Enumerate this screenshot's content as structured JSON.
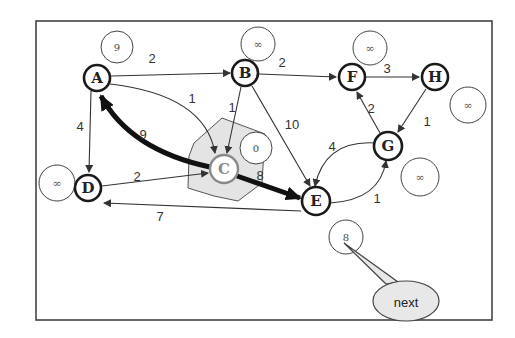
{
  "diagram": {
    "type": "weighted directed graph - Dijkstra shortest path step",
    "current_node": "C",
    "nodes": [
      {
        "id": "A",
        "label": "A",
        "x": 97,
        "y": 78,
        "distance": "9"
      },
      {
        "id": "B",
        "label": "B",
        "x": 245,
        "y": 73,
        "distance": "∞"
      },
      {
        "id": "C",
        "label": "C",
        "x": 224,
        "y": 169,
        "distance": "0"
      },
      {
        "id": "D",
        "label": "D",
        "x": 88,
        "y": 188,
        "distance": "∞"
      },
      {
        "id": "E",
        "label": "E",
        "x": 316,
        "y": 201,
        "distance": "8"
      },
      {
        "id": "F",
        "label": "F",
        "x": 352,
        "y": 77,
        "distance": "∞"
      },
      {
        "id": "G",
        "label": "G",
        "x": 388,
        "y": 146,
        "distance": "∞"
      },
      {
        "id": "H",
        "label": "H",
        "x": 435,
        "y": 77,
        "distance": "∞"
      }
    ],
    "edges": [
      {
        "from": "A",
        "to": "B",
        "weight": "2"
      },
      {
        "from": "A",
        "to": "C",
        "weight": "1"
      },
      {
        "from": "A",
        "to": "D",
        "weight": "4"
      },
      {
        "from": "C",
        "to": "A",
        "weight": "9",
        "highlighted": true
      },
      {
        "from": "B",
        "to": "C",
        "weight": "1"
      },
      {
        "from": "B",
        "to": "F",
        "weight": "2"
      },
      {
        "from": "B",
        "to": "E",
        "weight": "10"
      },
      {
        "from": "D",
        "to": "C",
        "weight": "2"
      },
      {
        "from": "C",
        "to": "E",
        "weight": "8",
        "highlighted": true
      },
      {
        "from": "E",
        "to": "D",
        "weight": "7"
      },
      {
        "from": "F",
        "to": "H",
        "weight": "3"
      },
      {
        "from": "H",
        "to": "G",
        "weight": "1"
      },
      {
        "from": "G",
        "to": "F",
        "weight": "2"
      },
      {
        "from": "G",
        "to": "E",
        "weight": "4"
      },
      {
        "from": "E",
        "to": "G",
        "weight": "1"
      }
    ],
    "callout": {
      "text": "next",
      "points_to": "E"
    }
  }
}
